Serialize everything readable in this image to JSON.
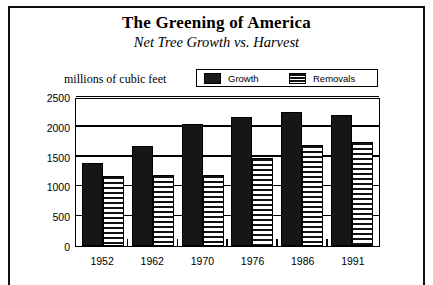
{
  "figure": {
    "title": "The Greening of America",
    "subtitle": "Net Tree Growth vs. Harvest",
    "units_label": "millions of cubic feet"
  },
  "legend": {
    "entries": [
      {
        "label": "Growth",
        "pattern": "solid",
        "swatch_icon": "solid-black-swatch-icon"
      },
      {
        "label": "Removals",
        "pattern": "striped",
        "swatch_icon": "horizontal-stripe-swatch-icon"
      }
    ]
  },
  "chart_data": {
    "type": "bar",
    "title": "The Greening of America",
    "subtitle": "Net Tree Growth vs. Harvest",
    "xlabel": "",
    "ylabel": "millions of cubic feet",
    "categories": [
      "1952",
      "1962",
      "1970",
      "1976",
      "1986",
      "1991"
    ],
    "series": [
      {
        "name": "Growth",
        "values": [
          1400,
          1670,
          2050,
          2170,
          2250,
          2200
        ]
      },
      {
        "name": "Removals",
        "values": [
          1180,
          1190,
          1190,
          1470,
          1700,
          1740
        ]
      }
    ],
    "ylim": [
      0,
      2500
    ],
    "yticks": [
      0,
      500,
      1000,
      1500,
      2000,
      2500
    ],
    "ytick_labels": [
      "0",
      "500",
      "1000",
      "1500",
      "2000",
      "2500"
    ],
    "grid": true,
    "legend_position": "top"
  }
}
